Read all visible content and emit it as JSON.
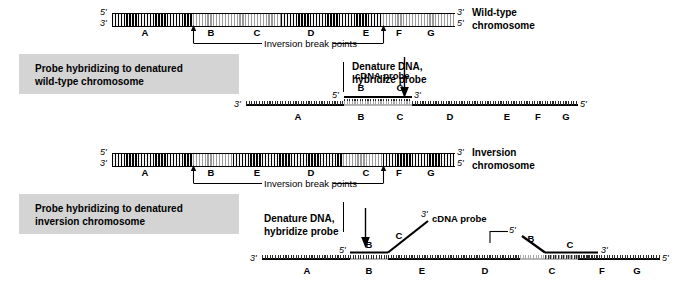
{
  "panel_wildtype": {
    "caption": "Probe hybridizing to denatured\nwild-type chromosome",
    "chromosome_label": "Wild-type\nchromosome",
    "prime_left_top": "5'",
    "prime_left_bottom": "3'",
    "prime_right_top": "3'",
    "prime_right_bottom": "5'",
    "segments": [
      "A",
      "B",
      "C",
      "D",
      "E",
      "F",
      "G"
    ],
    "breakpoint_label": "Inversion break points",
    "arrow_caption": "Denature DNA,\nhybridize probe",
    "probe_label": "cDNA probe",
    "probe_segments": [
      "B",
      "C"
    ],
    "probe_prime_left": "5'",
    "probe_prime_right": "3'",
    "strand_prime_left": "3'",
    "strand_prime_right": "5'",
    "strand_segments": [
      "A",
      "B",
      "C",
      "D",
      "E",
      "F",
      "G"
    ]
  },
  "panel_inversion": {
    "caption": "Probe hybridizing to denatured\ninversion chromosome",
    "chromosome_label": "Inversion\nchromosome",
    "prime_left_top": "5'",
    "prime_left_bottom": "3'",
    "prime_right_top": "3'",
    "prime_right_bottom": "5'",
    "segments": [
      "A",
      "B",
      "E",
      "D",
      "C",
      "F",
      "G"
    ],
    "breakpoint_label": "Inversion break points",
    "arrow_caption": "Denature DNA,\nhybridize probe",
    "probe_label": "cDNA probe",
    "probe1_segments": [
      "B",
      "C"
    ],
    "probe1_prime_left": "5'",
    "probe1_prime_right": "3'",
    "probe2_segments": [
      "B",
      "C"
    ],
    "probe2_prime_left": "5'",
    "probe2_prime_right": "3'",
    "strand_prime_left": "3'",
    "strand_prime_right": "5'",
    "strand_segments": [
      "A",
      "B",
      "E",
      "D",
      "C",
      "F",
      "G"
    ]
  },
  "colors": {
    "caption_box_bg": "#d4d4d4",
    "dark_band": "#000000",
    "light_band": "#9a9a9a",
    "ink": "#000000"
  }
}
